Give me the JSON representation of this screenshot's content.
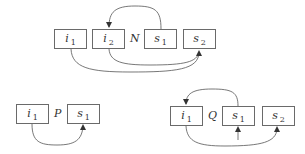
{
  "diagrams": [
    {
      "name": "N",
      "boxes": [
        {
          "var": "i",
          "sub": "1"
        },
        {
          "var": "i",
          "sub": "2"
        },
        {
          "var": "s",
          "sub": "1"
        },
        {
          "var": "s",
          "sub": "2"
        }
      ],
      "arrows": [
        {
          "from": "s1",
          "to": "i2",
          "route": "over-top"
        },
        {
          "from": "i1",
          "to": "s2",
          "route": "under-bottom"
        },
        {
          "from": "i2",
          "to": "s2",
          "route": "under-bottom"
        }
      ]
    },
    {
      "name": "P",
      "boxes": [
        {
          "var": "i",
          "sub": "1"
        },
        {
          "var": "s",
          "sub": "1"
        }
      ],
      "arrows": [
        {
          "from": "i1",
          "to": "s1",
          "route": "under-bottom"
        }
      ]
    },
    {
      "name": "Q",
      "boxes": [
        {
          "var": "i",
          "sub": "1"
        },
        {
          "var": "s",
          "sub": "1"
        },
        {
          "var": "s",
          "sub": "2"
        }
      ],
      "arrows": [
        {
          "from": "s1",
          "to": "i1",
          "route": "over-top"
        },
        {
          "from": "external",
          "to": "s1",
          "route": "from-below"
        },
        {
          "from": "i1",
          "to": "s2",
          "route": "under-bottom"
        }
      ]
    }
  ],
  "colors": {
    "stroke": "#555555",
    "text": "#333333",
    "background": "#ffffff"
  }
}
